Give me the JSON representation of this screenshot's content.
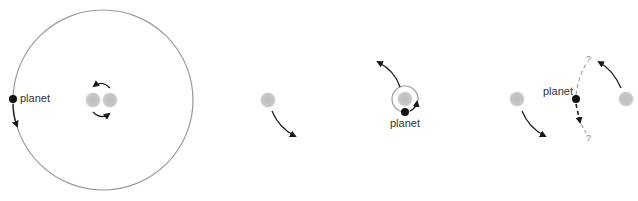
{
  "diagram": {
    "panels": [
      {
        "id": "circumbinary-orbit",
        "planet_label": "planet",
        "stars": 2,
        "orbit": "large circle around both stars"
      },
      {
        "id": "single-star-motion",
        "stars": 1
      },
      {
        "id": "s-type-orbit",
        "planet_label": "planet",
        "stars": 1,
        "orbit": "small circle around one star"
      },
      {
        "id": "unstable-between-stars",
        "planet_label": "planet",
        "stars": 2,
        "question_marks": [
          "?",
          "?"
        ]
      }
    ],
    "colors": {
      "star": "#c4c4c4",
      "orbit": "#9a9a9a",
      "planet": "#111111",
      "arrow": "#1a1a1a",
      "dashed_path": "#9a9a9a"
    }
  }
}
